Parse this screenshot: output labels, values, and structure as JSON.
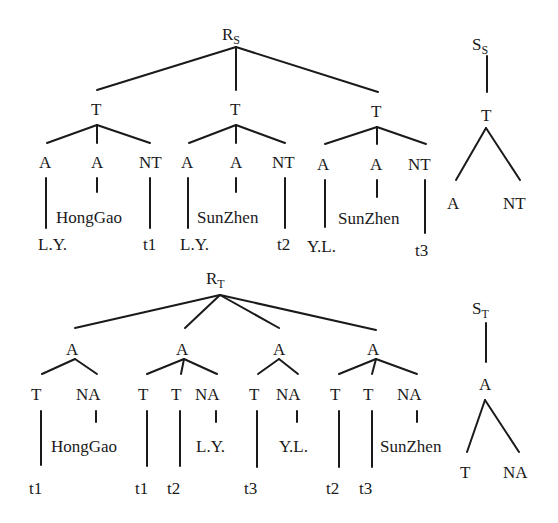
{
  "diagram": {
    "top": {
      "root": {
        "label": "R",
        "sub": "S"
      },
      "subtrees": [
        {
          "label": "T",
          "children": [
            "A",
            "A",
            "NT"
          ],
          "leaves": [
            "L.Y.",
            "HongGao",
            "t1"
          ]
        },
        {
          "label": "T",
          "children": [
            "A",
            "A",
            "NT"
          ],
          "leaves": [
            "L.Y.",
            "SunZhen",
            "t2"
          ]
        },
        {
          "label": "T",
          "children": [
            "A",
            "A",
            "NT"
          ],
          "leaves": [
            "Y.L.",
            "SunZhen",
            "t3"
          ]
        }
      ],
      "schema": {
        "root": {
          "label": "S",
          "sub": "S"
        },
        "node": "T",
        "children": [
          "A",
          "NT"
        ]
      }
    },
    "bottom": {
      "root": {
        "label": "R",
        "sub": "T"
      },
      "subtrees": [
        {
          "label": "A",
          "children": [
            "T",
            "NA"
          ],
          "leaves": [
            "t1",
            "HongGao"
          ]
        },
        {
          "label": "A",
          "children": [
            "T",
            "T",
            "NA"
          ],
          "leaves": [
            "t1",
            "t2",
            "L.Y."
          ]
        },
        {
          "label": "A",
          "children": [
            "T",
            "NA"
          ],
          "leaves": [
            "t3",
            "Y.L."
          ]
        },
        {
          "label": "A",
          "children": [
            "T",
            "T",
            "NA"
          ],
          "leaves": [
            "t2",
            "t3",
            "SunZhen"
          ]
        }
      ],
      "schema": {
        "root": {
          "label": "S",
          "sub": "T"
        },
        "node": "A",
        "children": [
          "T",
          "NA"
        ]
      }
    }
  }
}
